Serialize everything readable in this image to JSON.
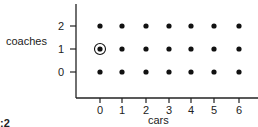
{
  "figure": {
    "label_fragment": ":2"
  },
  "chart_data": {
    "type": "scatter",
    "title": "",
    "xlabel": "cars",
    "ylabel": "coaches",
    "x_ticks": [
      "0",
      "1",
      "2",
      "3",
      "4",
      "5",
      "6"
    ],
    "y_ticks": [
      "0",
      "1",
      "2"
    ],
    "xlim": [
      0,
      6
    ],
    "ylim": [
      0,
      2
    ],
    "grid": false,
    "points": [
      {
        "x": 0,
        "y": 0
      },
      {
        "x": 1,
        "y": 0
      },
      {
        "x": 2,
        "y": 0
      },
      {
        "x": 3,
        "y": 0
      },
      {
        "x": 4,
        "y": 0
      },
      {
        "x": 5,
        "y": 0
      },
      {
        "x": 6,
        "y": 0
      },
      {
        "x": 0,
        "y": 1,
        "highlighted": true
      },
      {
        "x": 1,
        "y": 1
      },
      {
        "x": 2,
        "y": 1
      },
      {
        "x": 3,
        "y": 1
      },
      {
        "x": 4,
        "y": 1
      },
      {
        "x": 5,
        "y": 1
      },
      {
        "x": 6,
        "y": 1
      },
      {
        "x": 0,
        "y": 2
      },
      {
        "x": 1,
        "y": 2
      },
      {
        "x": 2,
        "y": 2
      },
      {
        "x": 3,
        "y": 2
      },
      {
        "x": 4,
        "y": 2
      },
      {
        "x": 5,
        "y": 2
      },
      {
        "x": 6,
        "y": 2
      }
    ],
    "annotations": [
      {
        "type": "circle",
        "x": 0,
        "y": 1
      }
    ]
  }
}
